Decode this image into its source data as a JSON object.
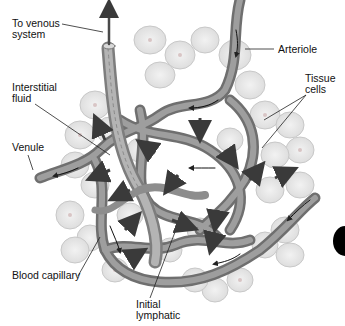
{
  "diagram": {
    "style": "grayscale anatomical illustration",
    "labels": [
      {
        "id": "to-venous-system",
        "text": "To venous\nsystem",
        "x": 12,
        "y": 18
      },
      {
        "id": "arteriole",
        "text": "Arteriole",
        "x": 278,
        "y": 44
      },
      {
        "id": "tissue-cells",
        "text": "Tissue\ncells",
        "x": 305,
        "y": 73
      },
      {
        "id": "interstitial-fluid",
        "text": "Interstitial\nfluid",
        "x": 12,
        "y": 82
      },
      {
        "id": "venule",
        "text": "Venule",
        "x": 12,
        "y": 142
      },
      {
        "id": "blood-capillary",
        "text": "Blood capillary",
        "x": 12,
        "y": 270
      },
      {
        "id": "initial-lymphatic",
        "text": "Initial\nlymphatic",
        "x": 136,
        "y": 299
      }
    ],
    "colors": {
      "background": "#ffffff",
      "cell_fill": "#e6e6e6",
      "cell_stroke": "#c4c4c4",
      "vessel": "#8c8c8c",
      "vessel_dark": "#5a5a5a",
      "arrow": "#333333",
      "edge_tab": "#000000"
    }
  }
}
